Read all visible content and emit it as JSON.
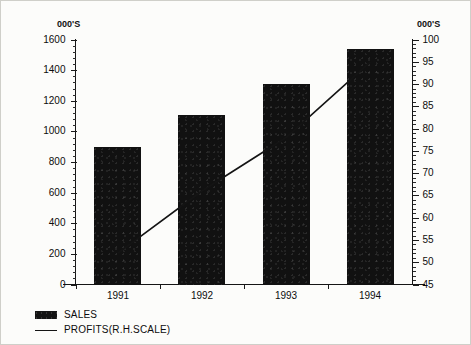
{
  "chart_data": {
    "type": "bar",
    "title": "",
    "subtitle": "",
    "xlabel": "",
    "ylabel": "000'S",
    "y2label": "000'S",
    "categories": [
      "1991",
      "1992",
      "1993",
      "1994"
    ],
    "grid": false,
    "legend_position": "bottom-left",
    "ylim": [
      0,
      1600
    ],
    "y2lim": [
      45,
      100
    ],
    "yticks": [
      0,
      200,
      400,
      600,
      800,
      1000,
      1200,
      1400,
      1600
    ],
    "y2ticks": [
      45,
      50,
      55,
      60,
      65,
      70,
      75,
      80,
      85,
      90,
      95,
      100
    ],
    "ytick_labels": [
      "0",
      "200",
      "400",
      "600",
      "800",
      "1000",
      "1200",
      "1400",
      "1600"
    ],
    "y2tick_labels": [
      "45",
      "50",
      "55",
      "60",
      "65",
      "70",
      "75",
      "80",
      "85",
      "90",
      "95",
      "100"
    ],
    "series": [
      {
        "name": "SALES",
        "type": "bar",
        "axis": "left",
        "color": "#111111",
        "values": [
          900,
          1110,
          1310,
          1540
        ]
      },
      {
        "name": "PROFITS(R.H.SCALE)",
        "type": "line",
        "axis": "right",
        "color": "#141414",
        "values": [
          52,
          66,
          78,
          95
        ]
      }
    ]
  },
  "axes": {
    "left_unit": "000'S",
    "right_unit": "000'S"
  },
  "legend": {
    "items": [
      {
        "label": "SALES",
        "marker": "filled-square"
      },
      {
        "label": "PROFITS(R.H.SCALE)",
        "marker": "line"
      }
    ]
  }
}
